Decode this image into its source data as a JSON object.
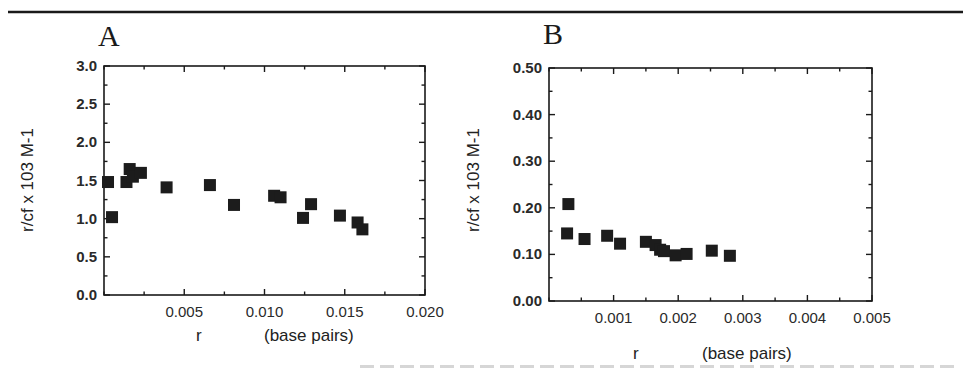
{
  "figure": {
    "top_rule": {
      "x1": 8,
      "x2": 963,
      "y": 12
    },
    "panels": [
      {
        "id": "A",
        "letter": "A",
        "letter_pos": {
          "x": 98,
          "y": 46
        },
        "plot": {
          "left": 104,
          "right": 425,
          "top": 66,
          "bottom": 295
        },
        "y_title": "r/cf x 103     M-1",
        "y_title_pos": {
          "x": 33,
          "y": 180
        },
        "x_title_r": "r",
        "x_title_bp": "(base pairs)",
        "x_title_pos": {
          "r_x": 196,
          "bp_x": 264,
          "y": 341
        }
      },
      {
        "id": "B",
        "letter": "B",
        "letter_pos": {
          "x": 543,
          "y": 44
        },
        "plot": {
          "left": 549,
          "right": 872,
          "top": 68,
          "bottom": 301
        },
        "y_title": "r/cf x 103     M-1",
        "y_title_pos": {
          "x": 479,
          "y": 180
        },
        "x_title_r": "r",
        "x_title_bp": "(base pairs)",
        "x_title_pos": {
          "r_x": 633,
          "bp_x": 702,
          "y": 359
        }
      }
    ],
    "caption_fragment": "(clipped caption text, illegible)"
  },
  "chart_data": [
    {
      "type": "scatter",
      "title": "A",
      "xlabel": "r    (base pairs)",
      "ylabel": "r/cf x 103    M-1",
      "xlim": [
        0,
        0.02
      ],
      "ylim": [
        0,
        3.0
      ],
      "x_ticks": [
        0.005,
        0.01,
        0.015,
        0.02
      ],
      "x_tick_labels": [
        "0.005",
        "0.010",
        "0.015",
        "0.020"
      ],
      "x_minor_step": 0.0025,
      "y_ticks": [
        0.0,
        0.5,
        1.0,
        1.5,
        2.0,
        2.5,
        3.0
      ],
      "y_tick_labels": [
        "0.0",
        "0.5",
        "1.0",
        "1.5",
        "2.0",
        "2.5",
        "3.0"
      ],
      "y_minor_step": 0.25,
      "grid": false,
      "legend": null,
      "marker": "filled-square",
      "series": [
        {
          "name": "A",
          "points": [
            {
              "x": 0.00025,
              "y": 1.48
            },
            {
              "x": 0.0005,
              "y": 1.02
            },
            {
              "x": 0.0014,
              "y": 1.48
            },
            {
              "x": 0.0016,
              "y": 1.65
            },
            {
              "x": 0.0018,
              "y": 1.55
            },
            {
              "x": 0.0023,
              "y": 1.6
            },
            {
              "x": 0.0039,
              "y": 1.41
            },
            {
              "x": 0.0066,
              "y": 1.44
            },
            {
              "x": 0.0081,
              "y": 1.18
            },
            {
              "x": 0.0106,
              "y": 1.3
            },
            {
              "x": 0.011,
              "y": 1.28
            },
            {
              "x": 0.0124,
              "y": 1.01
            },
            {
              "x": 0.0129,
              "y": 1.19
            },
            {
              "x": 0.0147,
              "y": 1.04
            },
            {
              "x": 0.0158,
              "y": 0.95
            },
            {
              "x": 0.0161,
              "y": 0.86
            }
          ]
        }
      ]
    },
    {
      "type": "scatter",
      "title": "B",
      "xlabel": "r    (base pairs)",
      "ylabel": "r/cf x 103    M-1",
      "xlim": [
        0,
        0.005
      ],
      "ylim": [
        0,
        0.5
      ],
      "x_ticks": [
        0.001,
        0.002,
        0.003,
        0.004,
        0.005
      ],
      "x_tick_labels": [
        "0.001",
        "0.002",
        "0.003",
        "0.004",
        "0.005"
      ],
      "x_minor_step": 0.0005,
      "y_ticks": [
        0.0,
        0.1,
        0.2,
        0.3,
        0.4,
        0.5
      ],
      "y_tick_labels": [
        "0.00",
        "0.10",
        "0.20",
        "0.30",
        "0.40",
        "0.50"
      ],
      "y_minor_step": 0.05,
      "grid": false,
      "legend": null,
      "marker": "filled-square",
      "series": [
        {
          "name": "B",
          "points": [
            {
              "x": 0.0003,
              "y": 0.208
            },
            {
              "x": 0.00028,
              "y": 0.145
            },
            {
              "x": 0.00055,
              "y": 0.133
            },
            {
              "x": 0.0009,
              "y": 0.14
            },
            {
              "x": 0.0011,
              "y": 0.123
            },
            {
              "x": 0.0015,
              "y": 0.127
            },
            {
              "x": 0.00165,
              "y": 0.12
            },
            {
              "x": 0.00172,
              "y": 0.11
            },
            {
              "x": 0.00178,
              "y": 0.107
            },
            {
              "x": 0.00196,
              "y": 0.098
            },
            {
              "x": 0.00213,
              "y": 0.101
            },
            {
              "x": 0.00252,
              "y": 0.108
            },
            {
              "x": 0.0028,
              "y": 0.097
            }
          ]
        }
      ]
    }
  ]
}
